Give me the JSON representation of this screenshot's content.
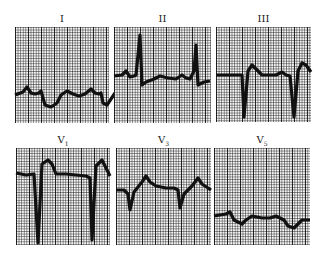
{
  "figure": {
    "type": "12-lead ECG excerpt",
    "leads": [
      {
        "id": "lead-I",
        "label": "I",
        "sub": "",
        "box": [
          15,
          27,
          94,
          96
        ],
        "path": "M0,68 L8,65 L12,60 L16,66 L20,67 L24,66 L26,64 L30,78 L36,80 L42,76 L46,68 L52,64 L58,67 L64,69 L70,67 L76,62 L80,66 L84,67 L86,66 L88,76 L92,78 L96,72 L100,66"
      },
      {
        "id": "lead-II",
        "label": "II",
        "sub": "",
        "box": [
          114,
          27,
          97,
          96
        ],
        "path": "M0,49 L8,48 L12,44 L16,50 L20,49 L22,48 L26,8 L28,58 L32,55 L40,52 L46,49 L54,51 L62,52 L68,48 L72,51 L76,52 L80,44 L82,18 L84,58 L90,55 L96,54"
      },
      {
        "id": "lead-III",
        "label": "III",
        "sub": "",
        "box": [
          216,
          27,
          95,
          95
        ],
        "path": "M0,48 L22,48 L26,48 L28,90 L32,44 L36,38 L40,42 L46,48 L60,48 L66,45 L70,48 L74,49 L78,90 L82,44 L86,36 L90,38 L95,45"
      },
      {
        "id": "lead-V1",
        "label": "V",
        "sub": "1",
        "box": [
          16,
          148,
          94,
          97
        ],
        "path": "M0,25 L10,27 L18,26 L22,95 L26,16 L32,12 L36,16 L40,26 L50,26 L60,27 L70,28 L74,30 L76,92 L80,18 L86,12 L90,20 L94,28"
      },
      {
        "id": "lead-V3",
        "label": "V",
        "sub": "3",
        "box": [
          116,
          148,
          95,
          97
        ],
        "path": "M0,42 L8,42 L12,46 L14,62 L18,44 L26,34 L30,28 L34,34 L40,38 L50,40 L58,40 L62,42 L64,60 L68,46 L76,38 L82,30 L86,36 L92,40 L95,42"
      },
      {
        "id": "lead-V5",
        "label": "V",
        "sub": "5",
        "box": [
          214,
          148,
          96,
          97
        ],
        "path": "M0,68 L12,66 L16,64 L20,72 L28,76 L32,72 L38,68 L48,70 L56,70 L62,68 L66,70 L70,72 L74,78 L80,80 L84,76 L88,72 L96,72"
      }
    ]
  }
}
